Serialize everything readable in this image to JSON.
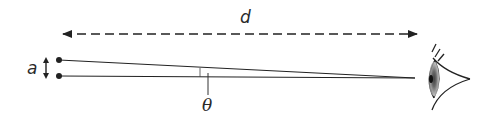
{
  "diagram": {
    "labels": {
      "distance": "d",
      "separation": "a",
      "angle": "θ"
    },
    "elements": [
      {
        "type": "dashed-double-arrow",
        "label": "d",
        "from": [
          62,
          34
        ],
        "to": [
          418,
          34
        ]
      },
      {
        "type": "point",
        "position": [
          59,
          60
        ]
      },
      {
        "type": "point",
        "position": [
          59,
          76
        ]
      },
      {
        "type": "line",
        "from": [
          59,
          60
        ],
        "to": [
          415,
          78
        ]
      },
      {
        "type": "line",
        "from": [
          59,
          76
        ],
        "to": [
          415,
          78
        ]
      },
      {
        "type": "double-arrow",
        "label": "a",
        "from": [
          46,
          58
        ],
        "to": [
          46,
          78
        ]
      },
      {
        "type": "angle-marker",
        "label": "θ",
        "position": [
          200,
          72
        ]
      },
      {
        "type": "eye",
        "position": [
          440,
          78
        ]
      }
    ],
    "colors": {
      "stroke": "#222222",
      "background": "#ffffff"
    }
  }
}
